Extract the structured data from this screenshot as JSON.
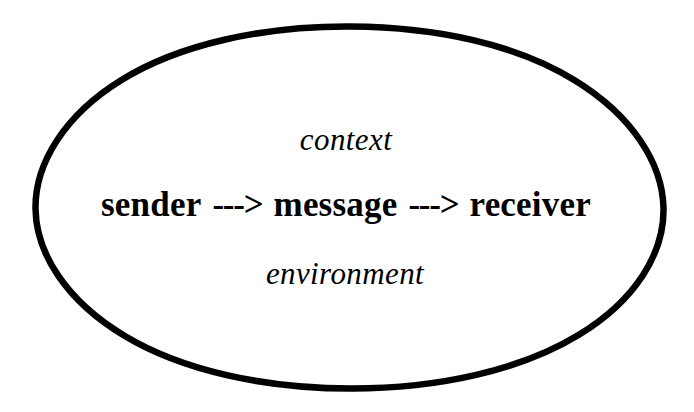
{
  "diagram": {
    "shape": {
      "name": "ellipse-outline",
      "stroke_color": "#000000",
      "fill_color": "#ffffff",
      "stroke_width": 6
    },
    "background_color": "#ffffff",
    "text_color": "#000000",
    "top_label": "context",
    "bottom_label": "environment",
    "flow": {
      "nodes": [
        "sender",
        "message",
        "receiver"
      ],
      "arrow": "--->",
      "arrow_1": "--->",
      "arrow_2": "--->"
    }
  }
}
